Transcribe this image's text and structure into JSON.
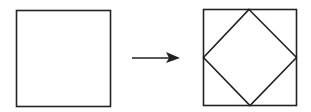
{
  "diagram": {
    "stroke_color": "#222222",
    "background": "#ffffff",
    "left_square": {
      "x": 16,
      "y": 10,
      "size": 94
    },
    "arrow": {
      "x1": 132,
      "y1": 58,
      "x2": 179,
      "y2": 58
    },
    "right_square": {
      "x": 203,
      "y": 9,
      "size": 94
    },
    "inscribed_diamond": {
      "points": "250,9 297,57 250,103 203,57"
    }
  }
}
